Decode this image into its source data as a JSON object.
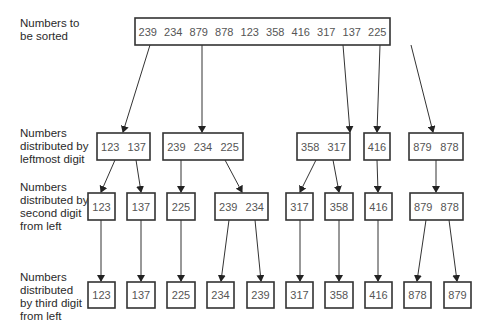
{
  "row_labels": [
    [
      "Numbers to",
      "be sorted"
    ],
    [
      "Numbers",
      "distributed by",
      "leftmost digit"
    ],
    [
      "Numbers",
      "distributed by",
      "second digit",
      "from left"
    ],
    [
      "Numbers",
      "distributed",
      "by third digit",
      "from left"
    ]
  ],
  "levels": [
    {
      "name": "unsorted",
      "groups": [
        [
          "239",
          "234",
          "879",
          "878",
          "123",
          "358",
          "416",
          "317",
          "137",
          "225"
        ]
      ]
    },
    {
      "name": "by-leftmost-digit",
      "groups": [
        [
          "123",
          "137"
        ],
        [
          "239",
          "234",
          "225"
        ],
        [
          "358",
          "317"
        ],
        [
          "416"
        ],
        [
          "879",
          "878"
        ]
      ]
    },
    {
      "name": "by-second-digit",
      "groups": [
        [
          "123"
        ],
        [
          "137"
        ],
        [
          "225"
        ],
        [
          "239",
          "234"
        ],
        [
          "317"
        ],
        [
          "358"
        ],
        [
          "416"
        ],
        [
          "879",
          "878"
        ]
      ]
    },
    {
      "name": "by-third-digit",
      "groups": [
        [
          "123"
        ],
        [
          "137"
        ],
        [
          "225"
        ],
        [
          "234"
        ],
        [
          "239"
        ],
        [
          "317"
        ],
        [
          "358"
        ],
        [
          "416"
        ],
        [
          "878"
        ],
        [
          "879"
        ]
      ]
    }
  ],
  "edges": [
    {
      "from": [
        0,
        0
      ],
      "to": [
        1,
        0
      ]
    },
    {
      "from": [
        0,
        0
      ],
      "to": [
        1,
        1
      ]
    },
    {
      "from": [
        0,
        0
      ],
      "to": [
        1,
        2
      ]
    },
    {
      "from": [
        0,
        0
      ],
      "to": [
        1,
        3
      ]
    },
    {
      "from": [
        0,
        0
      ],
      "to": [
        1,
        4
      ]
    },
    {
      "from": [
        1,
        0
      ],
      "to": [
        2,
        0
      ]
    },
    {
      "from": [
        1,
        0
      ],
      "to": [
        2,
        1
      ]
    },
    {
      "from": [
        1,
        1
      ],
      "to": [
        2,
        2
      ]
    },
    {
      "from": [
        1,
        1
      ],
      "to": [
        2,
        3
      ]
    },
    {
      "from": [
        1,
        2
      ],
      "to": [
        2,
        4
      ]
    },
    {
      "from": [
        1,
        2
      ],
      "to": [
        2,
        5
      ]
    },
    {
      "from": [
        1,
        3
      ],
      "to": [
        2,
        6
      ]
    },
    {
      "from": [
        1,
        4
      ],
      "to": [
        2,
        7
      ]
    },
    {
      "from": [
        2,
        0
      ],
      "to": [
        3,
        0
      ]
    },
    {
      "from": [
        2,
        1
      ],
      "to": [
        3,
        1
      ]
    },
    {
      "from": [
        2,
        2
      ],
      "to": [
        3,
        2
      ]
    },
    {
      "from": [
        2,
        3
      ],
      "to": [
        3,
        3
      ]
    },
    {
      "from": [
        2,
        3
      ],
      "to": [
        3,
        4
      ]
    },
    {
      "from": [
        2,
        4
      ],
      "to": [
        3,
        5
      ]
    },
    {
      "from": [
        2,
        5
      ],
      "to": [
        3,
        6
      ]
    },
    {
      "from": [
        2,
        6
      ],
      "to": [
        3,
        7
      ]
    },
    {
      "from": [
        2,
        7
      ],
      "to": [
        3,
        8
      ]
    },
    {
      "from": [
        2,
        7
      ],
      "to": [
        3,
        9
      ]
    }
  ]
}
